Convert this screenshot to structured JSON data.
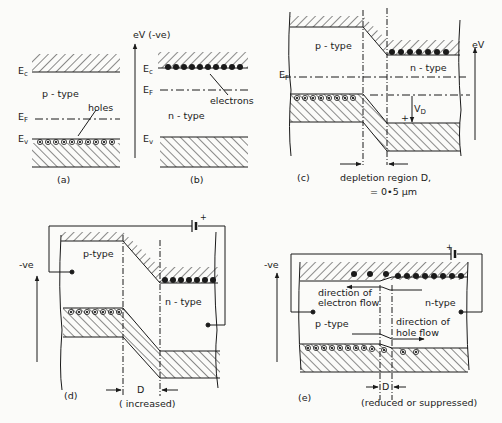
{
  "figure": {
    "background": "#fbfbf9",
    "ink_color": "#1a1a1a"
  },
  "panel_a": {
    "caption": "(a)",
    "ec_label": "E",
    "ec_sub": "c",
    "ef_label": "E",
    "ef_sub": "F",
    "ev_label": "E",
    "ev_sub": "v",
    "type_label": "p - type",
    "holes_label": "holes",
    "hole_count": 10
  },
  "panel_b": {
    "caption": "(b)",
    "axis_label": "eV (-ve)",
    "ec_label": "E",
    "ec_sub": "c",
    "ef_label": "E",
    "ef_sub": "F",
    "ev_label": "E",
    "ev_sub": "v",
    "type_label": "n - type",
    "electrons_label": "electrons",
    "electron_count": 10
  },
  "panel_c": {
    "caption": "(c)",
    "axis_label": "eV",
    "ef_label": "E",
    "ef_sub": "F",
    "p_label": "p - type",
    "n_label": "n - type",
    "vd_label": "V",
    "vd_sub": "D",
    "plus_sign": "+",
    "depletion_label": "depletion region D,",
    "depletion_value": "= 0•5 μm"
  },
  "panel_d": {
    "caption": "(d)",
    "axis_label": "-ve",
    "p_label": "p-type",
    "n_label": "n - type",
    "d_label": "D",
    "d_note": "( increased)",
    "battery_plus": "+"
  },
  "panel_e": {
    "caption": "(e)",
    "axis_label": "-ve",
    "p_label": "p -type",
    "n_label": "n-type",
    "electron_flow_label_1": "direction of",
    "electron_flow_label_2": "electron flow",
    "hole_flow_label_1": "direction of",
    "hole_flow_label_2": "hole flow",
    "d_label": "D",
    "d_note": "(reduced or suppressed)",
    "battery_plus": "+"
  }
}
